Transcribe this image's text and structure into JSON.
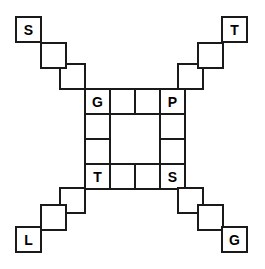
{
  "diagram": {
    "type": "grid-puzzle",
    "background_color": "#ffffff",
    "stroke_color": "#1a1a1a",
    "label_color": "#000000",
    "cell_size": 25,
    "stroke_width": 1.4,
    "canvas": {
      "width": 265,
      "height": 269
    },
    "ring": {
      "name": "center-ring",
      "description": "4 by 4 square ring of cells with hollow 2 by 2 interior",
      "origin": {
        "x": 85,
        "y": 89
      },
      "cols": 4,
      "rows": 4,
      "cells": [
        {
          "id": "ring-r0c0",
          "col": 0,
          "row": 0,
          "label": "G"
        },
        {
          "id": "ring-r0c1",
          "col": 1,
          "row": 0,
          "label": ""
        },
        {
          "id": "ring-r0c2",
          "col": 2,
          "row": 0,
          "label": ""
        },
        {
          "id": "ring-r0c3",
          "col": 3,
          "row": 0,
          "label": "P"
        },
        {
          "id": "ring-r1c0",
          "col": 0,
          "row": 1,
          "label": ""
        },
        {
          "id": "ring-r1c3",
          "col": 3,
          "row": 1,
          "label": ""
        },
        {
          "id": "ring-r2c0",
          "col": 0,
          "row": 2,
          "label": ""
        },
        {
          "id": "ring-r2c3",
          "col": 3,
          "row": 2,
          "label": ""
        },
        {
          "id": "ring-r3c0",
          "col": 0,
          "row": 3,
          "label": "T"
        },
        {
          "id": "ring-r3c1",
          "col": 1,
          "row": 3,
          "label": ""
        },
        {
          "id": "ring-r3c2",
          "col": 2,
          "row": 3,
          "label": ""
        },
        {
          "id": "ring-r3c3",
          "col": 3,
          "row": 3,
          "label": "S"
        }
      ]
    },
    "arms": [
      {
        "id": "arm-top-left",
        "name": "top-left-arm",
        "direction": "up-left",
        "terminal_label": "S",
        "cells": [
          {
            "id": "arm-tl-1",
            "x": 60,
            "y": 64,
            "label": ""
          },
          {
            "id": "arm-tl-2",
            "x": 41,
            "y": 43,
            "label": ""
          },
          {
            "id": "arm-tl-3",
            "x": 16,
            "y": 17,
            "label": "S"
          }
        ],
        "connector_cells": [
          {
            "id": "arm-tl-c1",
            "x": 60,
            "y": 64
          },
          {
            "id": "arm-tl-c2",
            "x": 41,
            "y": 43
          }
        ]
      },
      {
        "id": "arm-top-right",
        "name": "top-right-arm",
        "direction": "up-right",
        "terminal_label": "T",
        "cells": [
          {
            "id": "arm-tr-1",
            "x": 178,
            "y": 64,
            "label": ""
          },
          {
            "id": "arm-tr-2",
            "x": 198,
            "y": 43,
            "label": ""
          },
          {
            "id": "arm-tr-3",
            "x": 222,
            "y": 17,
            "label": "T"
          }
        ],
        "connector_cells": [
          {
            "id": "arm-tr-c1",
            "x": 178,
            "y": 64
          },
          {
            "id": "arm-tr-c2",
            "x": 198,
            "y": 43
          }
        ]
      },
      {
        "id": "arm-bottom-left",
        "name": "bottom-left-arm",
        "direction": "down-left",
        "terminal_label": "L",
        "cells": [
          {
            "id": "arm-bl-1",
            "x": 60,
            "y": 188
          },
          {
            "id": "arm-bl-2",
            "x": 41,
            "y": 205
          },
          {
            "id": "arm-bl-3",
            "x": 16,
            "y": 227,
            "label": "L"
          }
        ]
      },
      {
        "id": "arm-bottom-right",
        "name": "bottom-right-arm",
        "direction": "down-right",
        "terminal_label": "G",
        "cells": [
          {
            "id": "arm-br-1",
            "x": 178,
            "y": 188
          },
          {
            "id": "arm-br-2",
            "x": 198,
            "y": 205
          },
          {
            "id": "arm-br-3",
            "x": 222,
            "y": 227,
            "label": "G"
          }
        ]
      }
    ],
    "labels": {
      "ring_top_left": "G",
      "ring_top_right": "P",
      "ring_bottom_left": "T",
      "ring_bottom_right": "S",
      "terminal_top_left": "S",
      "terminal_top_right": "T",
      "terminal_bottom_left": "L",
      "terminal_bottom_right": "G"
    }
  }
}
